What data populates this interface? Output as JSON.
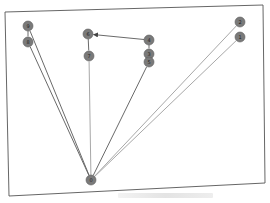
{
  "diagram": {
    "type": "directed-graph",
    "colors": {
      "frame": "#555555",
      "node_fill": "#7a7a7a",
      "node_stroke": "#5e5e5e",
      "label": "#222222",
      "edge_dark": "#6a6a6a",
      "edge_light": "#a8a8a8",
      "arrow": "#444444"
    },
    "frame": {
      "top_left": [
        5,
        12
      ],
      "top_right": [
        263,
        5
      ],
      "bottom_right": [
        265,
        183
      ],
      "bottom_left": [
        9,
        196
      ]
    },
    "nodes": [
      {
        "id": "0",
        "label": "0",
        "x": 91,
        "y": 180
      },
      {
        "id": "1",
        "label": "1",
        "x": 240,
        "y": 37
      },
      {
        "id": "2",
        "label": "2",
        "x": 240,
        "y": 22
      },
      {
        "id": "3",
        "label": "3",
        "x": 149,
        "y": 54
      },
      {
        "id": "4",
        "label": "4",
        "x": 149,
        "y": 40
      },
      {
        "id": "5",
        "label": "5",
        "x": 149,
        "y": 62
      },
      {
        "id": "6",
        "label": "6",
        "x": 88,
        "y": 34
      },
      {
        "id": "7",
        "label": "7",
        "x": 89,
        "y": 56
      },
      {
        "id": "8",
        "label": "8",
        "x": 28,
        "y": 42
      },
      {
        "id": "9",
        "label": "9",
        "x": 28,
        "y": 26
      }
    ],
    "edges": [
      {
        "source": "0",
        "target": "8",
        "style": "dark"
      },
      {
        "source": "0",
        "target": "9",
        "style": "dark"
      },
      {
        "source": "0",
        "target": "7",
        "style": "light"
      },
      {
        "source": "0",
        "target": "5",
        "style": "dark"
      },
      {
        "source": "0",
        "target": "1",
        "style": "light"
      },
      {
        "source": "0",
        "target": "2",
        "style": "light"
      },
      {
        "source": "9",
        "target": "8",
        "style": "dark"
      },
      {
        "source": "6",
        "target": "7",
        "style": "dark"
      },
      {
        "source": "4",
        "target": "6",
        "style": "dark",
        "arrow": true
      },
      {
        "source": "4",
        "target": "3",
        "style": "dark"
      },
      {
        "source": "3",
        "target": "5",
        "style": "dark"
      }
    ],
    "node_radius": 5
  }
}
